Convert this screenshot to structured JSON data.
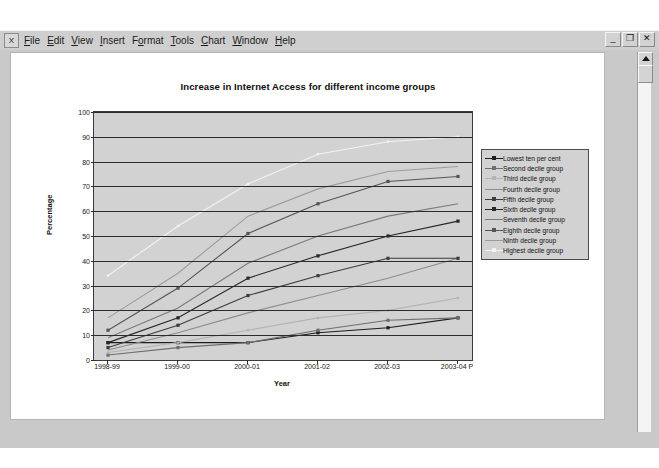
{
  "window": {
    "app_icon": "excel-icon",
    "menu": [
      {
        "label": "File",
        "accel": "F"
      },
      {
        "label": "Edit",
        "accel": "E"
      },
      {
        "label": "View",
        "accel": "V"
      },
      {
        "label": "Insert",
        "accel": "I"
      },
      {
        "label": "Format",
        "accel": "o"
      },
      {
        "label": "Tools",
        "accel": "T"
      },
      {
        "label": "Chart",
        "accel": "C"
      },
      {
        "label": "Window",
        "accel": "W"
      },
      {
        "label": "Help",
        "accel": "H"
      }
    ],
    "controls": {
      "minimize": "_",
      "restore": "❐",
      "close": "✕"
    },
    "scrollbar": {
      "up_arrow": "scroll-up"
    }
  },
  "chart_data": {
    "type": "line",
    "title": "Increase in Internet Access for different income groups",
    "xlabel": "Year",
    "ylabel": "Percentage",
    "categories": [
      "1998-99",
      "1999-00",
      "2000-01",
      "2001-02",
      "2002-03",
      "2003-04 P"
    ],
    "ylim": [
      0,
      100
    ],
    "ytick_step": 10,
    "yticks": [
      0,
      10,
      20,
      30,
      40,
      50,
      60,
      70,
      80,
      90,
      100
    ],
    "grid": "horizontal",
    "legend_position": "right",
    "plot_background": "#d2d2d2",
    "series": [
      {
        "name": "Lowest ten per cent",
        "color": "#1c1c1c",
        "marker": "square",
        "values": [
          7,
          7,
          7,
          11,
          13,
          17
        ]
      },
      {
        "name": "Second decile group",
        "color": "#6e6e6e",
        "marker": "square",
        "values": [
          2,
          5,
          7,
          12,
          16,
          17
        ]
      },
      {
        "name": "Third decile group",
        "color": "#b4b4b4",
        "marker": "dot",
        "values": [
          3,
          7,
          12,
          17,
          20,
          25
        ]
      },
      {
        "name": "Fourth decile group",
        "color": "#8c8c8c",
        "marker": "none",
        "values": [
          4,
          11,
          19,
          26,
          33,
          41
        ]
      },
      {
        "name": "Fifth decile group",
        "color": "#3c3c3c",
        "marker": "square",
        "values": [
          5,
          14,
          26,
          34,
          41,
          41
        ]
      },
      {
        "name": "Sixth decile group",
        "color": "#262626",
        "marker": "square",
        "values": [
          7,
          17,
          33,
          42,
          50,
          56
        ]
      },
      {
        "name": "Seventh decile group",
        "color": "#7a7a7a",
        "marker": "none",
        "values": [
          9,
          21,
          39,
          50,
          58,
          63
        ]
      },
      {
        "name": "Eighth decile group",
        "color": "#555555",
        "marker": "square",
        "values": [
          12,
          29,
          51,
          63,
          72,
          74
        ]
      },
      {
        "name": "Ninth decile group",
        "color": "#9c9c9c",
        "marker": "none",
        "values": [
          17,
          35,
          58,
          69,
          76,
          78
        ]
      },
      {
        "name": "Highest decile group",
        "color": "#f2f2f2",
        "marker": "dot",
        "values": [
          34,
          54,
          71,
          83,
          88,
          90
        ]
      }
    ]
  }
}
